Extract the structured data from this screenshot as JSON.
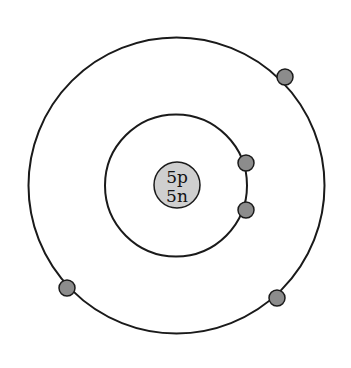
{
  "diagram": {
    "type": "bohr-atom-model",
    "nucleus": {
      "protons_label": "5p",
      "neutrons_label": "5n",
      "fill": "#cfcfcf",
      "cx": 177,
      "cy": 185,
      "r": 23
    },
    "shells": [
      {
        "name": "inner-shell",
        "cx": 176,
        "cy": 185.5,
        "r": 75,
        "electron_count": 2
      },
      {
        "name": "outer-shell",
        "cx": 176.5,
        "cy": 185.5,
        "r": 148,
        "electron_count": 3
      }
    ],
    "electrons": [
      {
        "shell": 1,
        "cx": 246,
        "cy": 163
      },
      {
        "shell": 1,
        "cx": 246,
        "cy": 210
      },
      {
        "shell": 2,
        "cx": 285,
        "cy": 77
      },
      {
        "shell": 2,
        "cx": 67,
        "cy": 288
      },
      {
        "shell": 2,
        "cx": 277,
        "cy": 298
      }
    ],
    "colors": {
      "stroke": "#1a1a1a",
      "electron_fill": "#8c8c8c",
      "nucleus_fill": "#cfcfcf",
      "background": "#ffffff"
    }
  }
}
